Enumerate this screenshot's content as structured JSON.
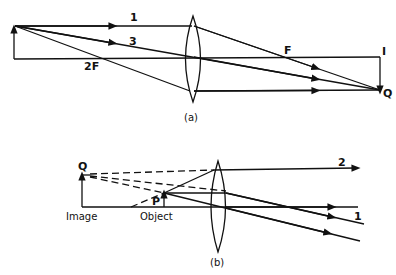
{
  "figure_a": {
    "caption": "(a)",
    "labels": {
      "ray1": "1",
      "ray3": "3",
      "two_f": "2F",
      "focus": "F",
      "image": "I",
      "image_tip": "Q"
    }
  },
  "figure_b": {
    "caption": "(b)",
    "labels": {
      "image_tip": "Q",
      "object_tip": "P",
      "image": "Image",
      "object": "Object",
      "ray1": "1",
      "ray2": "2"
    }
  },
  "colors": {
    "line": "#111111",
    "background": "#ffffff"
  }
}
